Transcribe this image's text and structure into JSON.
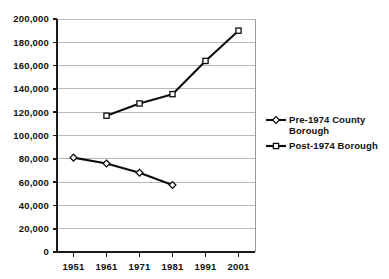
{
  "chart_data": {
    "type": "line",
    "title": "",
    "subtitle": "",
    "xlabel": "",
    "ylabel": "",
    "categories": [
      "1951",
      "1961",
      "1971",
      "1981",
      "1991",
      "2001"
    ],
    "x": [
      1951,
      1961,
      1971,
      1981,
      1991,
      2001
    ],
    "ylim": [
      0,
      200000
    ],
    "xlim": [
      1946,
      2006
    ],
    "grid": true,
    "legend_position": "right",
    "yticks": [
      0,
      20000,
      40000,
      60000,
      80000,
      100000,
      120000,
      140000,
      160000,
      180000,
      200000
    ],
    "ytick_labels": [
      "0",
      "20,000",
      "40,000",
      "60,000",
      "80,000",
      "100,000",
      "120,000",
      "140,000",
      "160,000",
      "180,000",
      "200,000"
    ],
    "xtick_labels": [
      "1951",
      "1961",
      "1971",
      "1981",
      "1991",
      "2001"
    ],
    "series": [
      {
        "name": "Pre-1974 County Borough",
        "marker": "diamond",
        "color": "#0d0d0d",
        "x": [
          1951,
          1961,
          1971,
          1981
        ],
        "values": [
          81000,
          76000,
          68000,
          57500
        ]
      },
      {
        "name": "Post-1974 Borough",
        "marker": "square",
        "color": "#0d0d0d",
        "x": [
          1961,
          1971,
          1981,
          1991,
          2001
        ],
        "values": [
          117000,
          127500,
          135500,
          164000,
          190000
        ]
      }
    ]
  },
  "legend": {
    "items": [
      {
        "label_line1": "Pre-1974 County",
        "label_line2": "Borough",
        "marker": "diamond-marker"
      },
      {
        "label_line1": "Post-1974 Borough",
        "label_line2": "",
        "marker": "square-marker"
      }
    ]
  },
  "axis": {
    "y_labels": [
      "200,000",
      "180,000",
      "160,000",
      "140,000",
      "120,000",
      "100,000",
      "80,000",
      "60,000",
      "40,000",
      "20,000",
      "0"
    ],
    "x_labels": [
      "1951",
      "1961",
      "1971",
      "1981",
      "1991",
      "2001"
    ]
  }
}
